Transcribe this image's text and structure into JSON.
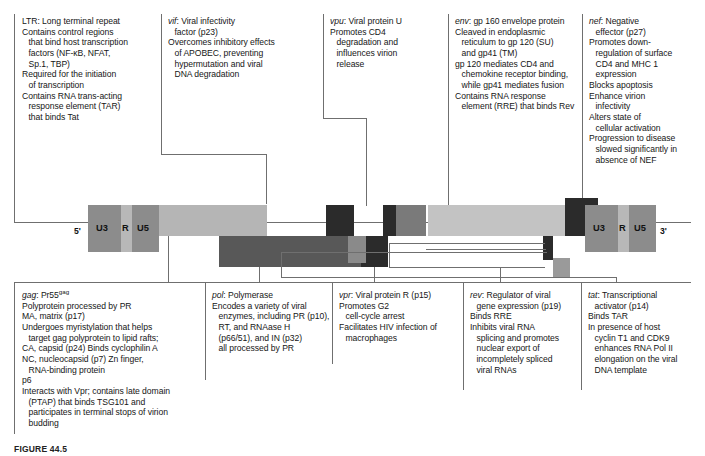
{
  "figure": {
    "caption": "FIGURE 44.5",
    "colors": {
      "ltr_outer": "#8c8c8c",
      "ltr_r": "#b8b8b8",
      "gag": "#b5b5b5",
      "pol": "#6b6b6b",
      "vif": "#2b2b2b",
      "vpr": "#2b2b2b",
      "tat_block": "#8a8a8a",
      "rev_block": "#2b2b2b",
      "vpu": "#7a7a7a",
      "env": "#c3c3c3",
      "nef": "#2b2b2b",
      "outline": "#6f6f6f"
    }
  },
  "genome": {
    "five_prime_label": "5'",
    "three_prime_label": "3'",
    "ltr_segments": [
      "U3",
      "R",
      "U5"
    ]
  },
  "annotations": {
    "ltr": {
      "gene": "LTR",
      "lines": [
        {
          "text": "LTR: Long terminal repeat",
          "indent": false,
          "gene_prefix": "LTR"
        },
        {
          "text": "Contains control regions",
          "indent": false
        },
        {
          "text": "that bind host transcription",
          "indent": true
        },
        {
          "text": "factors (NF-κB, NFAT,",
          "indent": true
        },
        {
          "text": "Sp.1, TBP)",
          "indent": true
        },
        {
          "text": "Required for the initiation",
          "indent": false
        },
        {
          "text": "of transcription",
          "indent": true
        },
        {
          "text": "Contains RNA trans-acting",
          "indent": false
        },
        {
          "text": "response element (TAR)",
          "indent": true
        },
        {
          "text": "that binds Tat",
          "indent": true
        }
      ]
    },
    "vif": {
      "gene": "vif",
      "lines": [
        {
          "text": "vif: Viral infectivity",
          "indent": false,
          "italic_head": "vif"
        },
        {
          "text": "factor (p23)",
          "indent": true
        },
        {
          "text": "Overcomes inhibitory effects",
          "indent": false
        },
        {
          "text": "of APOBEC, preventing",
          "indent": true
        },
        {
          "text": "hypermutation and viral",
          "indent": true
        },
        {
          "text": "DNA degradation",
          "indent": true
        }
      ]
    },
    "vpu": {
      "gene": "vpu",
      "lines": [
        {
          "text": "vpu: Viral protein U",
          "indent": false,
          "italic_head": "vpu"
        },
        {
          "text": "Promotes CD4",
          "indent": false
        },
        {
          "text": "degradation and",
          "indent": true
        },
        {
          "text": "influences virion",
          "indent": true
        },
        {
          "text": "release",
          "indent": true
        }
      ]
    },
    "env": {
      "gene": "env",
      "lines": [
        {
          "text": "env: gp 160 envelope protein",
          "indent": false,
          "italic_head": "env"
        },
        {
          "text": "Cleaved in endoplasmic",
          "indent": false
        },
        {
          "text": "reticulum to gp 120 (SU)",
          "indent": true
        },
        {
          "text": "and gp41 (TM)",
          "indent": true
        },
        {
          "text": "gp 120 mediates CD4 and",
          "indent": false
        },
        {
          "text": "chemokine receptor binding,",
          "indent": true
        },
        {
          "text": "while gp41 mediates fusion",
          "indent": true
        },
        {
          "text": "Contains RNA response",
          "indent": false
        },
        {
          "text": "element (RRE) that binds Rev",
          "indent": true
        }
      ]
    },
    "nef": {
      "gene": "nef",
      "lines": [
        {
          "text": "nef: Negative",
          "indent": false,
          "italic_head": "nef"
        },
        {
          "text": "effector (p27)",
          "indent": true
        },
        {
          "text": "Promotes down-",
          "indent": false
        },
        {
          "text": "regulation of surface",
          "indent": true
        },
        {
          "text": "CD4 and MHC 1",
          "indent": true
        },
        {
          "text": "expression",
          "indent": true
        },
        {
          "text": "Blocks apoptosis",
          "indent": false
        },
        {
          "text": "Enhance virion",
          "indent": false
        },
        {
          "text": "infectivity",
          "indent": true
        },
        {
          "text": "Alters state of",
          "indent": false
        },
        {
          "text": "cellular activation",
          "indent": true
        },
        {
          "text": "Progression to disease",
          "indent": false
        },
        {
          "text": "slowed significantly in",
          "indent": true
        },
        {
          "text": "absence of NEF",
          "indent": true
        }
      ]
    },
    "gag": {
      "gene": "gag",
      "lines": [
        {
          "text": "gag: Pr55gag",
          "indent": false,
          "italic_head": "gag",
          "sup_tail": "gag",
          "base_tail": "gag: Pr55"
        },
        {
          "text": "Polyprotein processed by PR",
          "indent": false
        },
        {
          "text": "MA, matrix (p17)",
          "indent": false
        },
        {
          "text": "Undergoes myristylation that helps",
          "indent": false
        },
        {
          "text": "target gag polyprotein to lipid rafts;",
          "indent": true
        },
        {
          "text": "CA, capsid (p24) Binds cyclophilin A",
          "indent": false
        },
        {
          "text": "NC, nucleocapsid (p7) Zn finger,",
          "indent": false
        },
        {
          "text": "RNA-binding protein",
          "indent": true
        },
        {
          "text": "p6",
          "indent": false
        },
        {
          "text": "Interacts with Vpr; contains late domain",
          "indent": false
        },
        {
          "text": "(PTAP) that binds TSG101 and",
          "indent": true
        },
        {
          "text": "participates in terminal stops of virion",
          "indent": true
        },
        {
          "text": "budding",
          "indent": true
        }
      ]
    },
    "pol": {
      "gene": "pol",
      "lines": [
        {
          "text": "pol: Polymerase",
          "indent": false,
          "italic_head": "pol"
        },
        {
          "text": "Encodes a variety of viral",
          "indent": false
        },
        {
          "text": "enzymes, including PR (p10),",
          "indent": true
        },
        {
          "text": "RT, and RNAase H",
          "indent": true
        },
        {
          "text": "(p66/51), and IN (p32)",
          "indent": true
        },
        {
          "text": "all processed by PR",
          "indent": true
        }
      ]
    },
    "vpr": {
      "gene": "vpr",
      "lines": [
        {
          "text": "vpr: Viral protein R (p15)",
          "indent": false,
          "italic_head": "vpr"
        },
        {
          "text": "Promotes G2",
          "indent": false
        },
        {
          "text": "cell-cycle arrest",
          "indent": true
        },
        {
          "text": "Facilitates HIV infection of",
          "indent": false
        },
        {
          "text": "macrophages",
          "indent": true
        }
      ]
    },
    "rev": {
      "gene": "rev",
      "lines": [
        {
          "text": "rev: Regulator of viral",
          "indent": false,
          "italic_head": "rev"
        },
        {
          "text": "gene expression (p19)",
          "indent": true
        },
        {
          "text": "Binds RRE",
          "indent": false
        },
        {
          "text": "Inhibits viral RNA",
          "indent": false
        },
        {
          "text": "splicing and promotes",
          "indent": true
        },
        {
          "text": "nuclear export of",
          "indent": true
        },
        {
          "text": "incompletely spliced",
          "indent": true
        },
        {
          "text": "viral RNAs",
          "indent": true
        }
      ]
    },
    "tat": {
      "gene": "tat",
      "lines": [
        {
          "text": "tat: Transcriptional",
          "indent": false,
          "italic_head": "tat"
        },
        {
          "text": "activator (p14)",
          "indent": true
        },
        {
          "text": "Binds TAR",
          "indent": false
        },
        {
          "text": "In presence of host",
          "indent": false
        },
        {
          "text": "cyclin T1 and CDK9",
          "indent": true
        },
        {
          "text": "enhances RNA Pol II",
          "indent": true
        },
        {
          "text": "elongation on the viral",
          "indent": true
        },
        {
          "text": "DNA template",
          "indent": true
        }
      ]
    }
  }
}
